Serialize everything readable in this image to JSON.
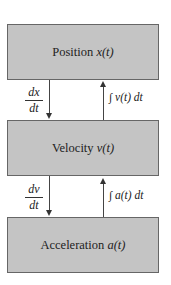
{
  "boxes": [
    {
      "label": "Position",
      "var": "x(t)"
    },
    {
      "label": "Velocity",
      "var": "v(t)"
    },
    {
      "label": "Acceleration",
      "var": "a(t)"
    }
  ],
  "derivatives": [
    {
      "num": "dx",
      "den": "dt"
    },
    {
      "num": "dv",
      "den": "dt"
    }
  ],
  "integrals": [
    {
      "symbol": "∫",
      "expr": "v(t) dt"
    },
    {
      "symbol": "∫",
      "expr": "a(t) dt"
    }
  ]
}
